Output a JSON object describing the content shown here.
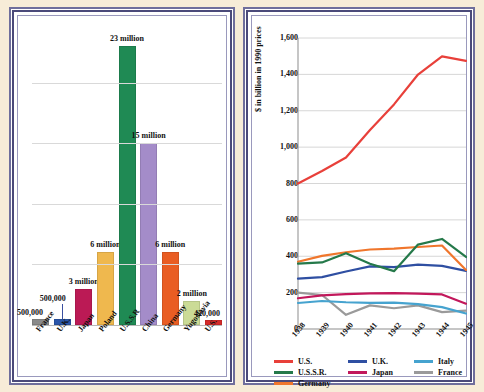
{
  "figure": {
    "background_color": "#f7ecd8",
    "panel_border_color": "#4b4a7a"
  },
  "chart_data": [
    {
      "id": "casualties-bar",
      "type": "bar",
      "title": "",
      "xlabel": "",
      "ylabel": "",
      "ylim": [
        0,
        24
      ],
      "grid": true,
      "gridlines": [
        5,
        10,
        15,
        20
      ],
      "categories": [
        "France",
        "U.K.",
        "Japan",
        "Poland",
        "U.S.S.R",
        "China",
        "Germany",
        "Yugoslavia",
        "U.S."
      ],
      "values": [
        0.5,
        0.5,
        3,
        6,
        23,
        15,
        6,
        2,
        0.42
      ],
      "value_labels": [
        "500,000",
        "500,000",
        "3 million",
        "6 million",
        "23 million",
        "15 million",
        "6 million",
        "2 million",
        "420,000"
      ],
      "colors": [
        "#8a8a8a",
        "#2a55a8",
        "#bb1a55",
        "#efb84e",
        "#1f8a54",
        "#a48cc9",
        "#e95d23",
        "#cbdb96",
        "#d62b2b"
      ]
    },
    {
      "id": "war-expenditure-line",
      "type": "line",
      "title": "",
      "xlabel": "",
      "ylabel": "$ in billion in 1990 prices",
      "ylim": [
        0,
        1600
      ],
      "yticks": [
        0,
        200,
        400,
        600,
        800,
        1000,
        1200,
        1400,
        1600
      ],
      "ytick_labels": [
        "0",
        "200",
        "400",
        "600",
        "800",
        "1,000",
        "1,200",
        "1,400",
        "1,600"
      ],
      "grid": true,
      "legend_position": "bottom",
      "x": [
        "1938",
        "1939",
        "1940",
        "1941",
        "1942",
        "1943",
        "1944",
        "1945"
      ],
      "series": [
        {
          "name": "U.S.",
          "color": "#e8403a",
          "values": [
            800,
            869,
            943,
            1094,
            1235,
            1399,
            1499,
            1474
          ]
        },
        {
          "name": "U.S.S.R.",
          "color": "#25794a",
          "values": [
            359,
            366,
            417,
            359,
            318,
            464,
            495,
            396
          ]
        },
        {
          "name": "Germany",
          "color": "#f0762c",
          "values": [
            370,
            402,
            422,
            437,
            442,
            451,
            459,
            324
          ]
        },
        {
          "name": "U.K.",
          "color": "#2f4fa2",
          "values": [
            277,
            285,
            316,
            344,
            340,
            354,
            347,
            320
          ]
        },
        {
          "name": "Japan",
          "color": "#c2185b",
          "values": [
            169,
            185,
            192,
            196,
            197,
            194,
            190,
            139
          ]
        },
        {
          "name": "Italy",
          "color": "#46a3cf",
          "values": [
            143,
            154,
            147,
            144,
            145,
            137,
            120,
            85
          ]
        },
        {
          "name": "France",
          "color": "#9a9a9a",
          "values": [
            200,
            187,
            78,
            130,
            114,
            130,
            93,
            101
          ]
        }
      ]
    }
  ]
}
